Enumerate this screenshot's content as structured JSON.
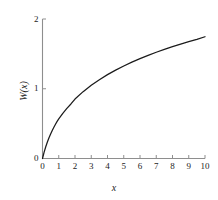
{
  "chart_data": {
    "type": "line",
    "title": "",
    "subtitle": "",
    "xlabel": "x",
    "ylabel": "W(x)",
    "xlim": [
      0,
      10
    ],
    "ylim": [
      0,
      2
    ],
    "grid": false,
    "legend": null,
    "xticks": [
      "0",
      "1",
      "2",
      "3",
      "4",
      "5",
      "6",
      "7",
      "8",
      "9",
      "10"
    ],
    "xtick_values": [
      0,
      1,
      2,
      3,
      4,
      5,
      6,
      7,
      8,
      9,
      10
    ],
    "yticks": [
      "0",
      "1",
      "2"
    ],
    "ytick_values": [
      0,
      1,
      2
    ],
    "series": [
      {
        "name": "W(x)",
        "color": "#1b1b1b",
        "x": [
          0,
          0.1,
          0.2,
          0.3,
          0.4,
          0.5,
          0.6,
          0.7,
          0.8,
          0.9,
          1,
          1.25,
          1.5,
          1.75,
          2,
          2.5,
          3,
          3.5,
          4,
          4.5,
          5,
          5.5,
          6,
          6.5,
          7,
          7.5,
          8,
          8.5,
          9,
          9.5,
          10
        ],
        "y": [
          0,
          0.0912,
          0.1689,
          0.2367,
          0.297,
          0.3517,
          0.4018,
          0.4484,
          0.4918,
          0.5326,
          0.5671,
          0.6472,
          0.718,
          0.7818,
          0.8526,
          0.9585,
          1.0499,
          1.1301,
          1.2022,
          1.2672,
          1.3267,
          1.3813,
          1.4319,
          1.4789,
          1.5229,
          1.5642,
          1.6031,
          1.6399,
          1.6749,
          1.7082,
          1.7455
        ]
      }
    ],
    "annotations": [],
    "axis_color": "#8e8e8e",
    "curve_color": "#1b1b1b",
    "background_color": "#ffffff"
  },
  "figure": {
    "caption": "",
    "axis_title_x": "x",
    "axis_title_y": "W(x)"
  }
}
